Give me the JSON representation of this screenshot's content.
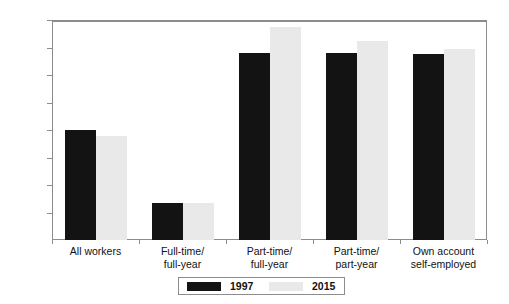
{
  "chart_data": {
    "type": "bar",
    "title": "",
    "subtitle": "",
    "xlabel": "",
    "ylabel": "",
    "ylim": [
      0,
      80
    ],
    "grid": false,
    "legend_position": "bottom",
    "y_ticks": [
      "0",
      "10",
      "20",
      "30",
      "40",
      "50",
      "60",
      "70",
      "80%"
    ],
    "y_tick_values": [
      0,
      10,
      20,
      30,
      40,
      50,
      60,
      70,
      80
    ],
    "categories": [
      "All workers",
      "Full-time/ full-year",
      "Part-time/ full-year",
      "Part-time/ part-year",
      "Own account self-employed"
    ],
    "category_lines": [
      [
        "All workers",
        ""
      ],
      [
        "Full-time/",
        "full-year"
      ],
      [
        "Part-time/",
        "full-year"
      ],
      [
        "Part-time/",
        "part-year"
      ],
      [
        "Own account",
        "self-employed"
      ]
    ],
    "series": [
      {
        "name": "1997",
        "color": "#131313",
        "values": [
          40,
          13.5,
          68,
          68,
          67.5
        ]
      },
      {
        "name": "2015",
        "color": "#e9e9e9",
        "values": [
          38,
          13.5,
          77.5,
          72.5,
          69.5
        ]
      }
    ]
  },
  "legend": {
    "items": [
      {
        "label": "1997",
        "color": "#131313"
      },
      {
        "label": "2015",
        "color": "#e9e9e9"
      }
    ]
  },
  "colors": {
    "series_1997": "#131313",
    "series_2015": "#e9e9e9",
    "axis": "#8c8c8c",
    "text": "#111111",
    "background": "#ffffff"
  }
}
